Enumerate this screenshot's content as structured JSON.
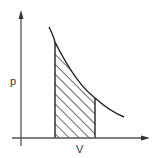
{
  "diagram": {
    "type": "pv-diagram",
    "axes": {
      "y_label": "p",
      "x_label": "V"
    },
    "curve": {
      "description": "decreasing hyperbolic curve (p ∝ 1/V)",
      "color": "#222222"
    },
    "shaded_region": {
      "description": "area under curve between two volumes, hatched diagonally",
      "hatch_color": "#222222"
    },
    "colors": {
      "background": "#ffffff",
      "line": "#222222",
      "axis": "#555555"
    }
  }
}
